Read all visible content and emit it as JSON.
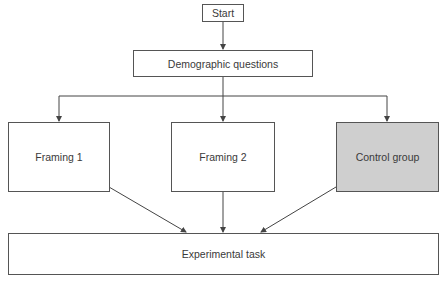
{
  "diagram": {
    "type": "flowchart",
    "nodes": {
      "start": "Start",
      "demographic": "Demographic questions",
      "framing1": "Framing 1",
      "framing2": "Framing 2",
      "control": "Control group",
      "experimental": "Experimental task"
    },
    "colors": {
      "line": "#444444",
      "box_fill": "#ffffff",
      "control_fill": "#cfcfcf"
    },
    "edges": [
      [
        "start",
        "demographic"
      ],
      [
        "demographic",
        "framing1"
      ],
      [
        "demographic",
        "framing2"
      ],
      [
        "demographic",
        "control"
      ],
      [
        "framing1",
        "experimental"
      ],
      [
        "framing2",
        "experimental"
      ],
      [
        "control",
        "experimental"
      ]
    ]
  }
}
